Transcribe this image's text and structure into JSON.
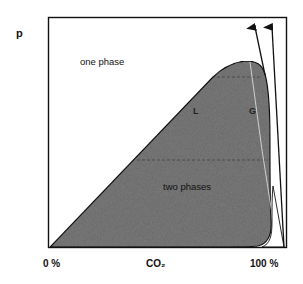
{
  "diagram": {
    "title": "",
    "y_axis_label": "p",
    "x_axis_label": "CO₂",
    "x_tick_left": "0 %",
    "x_tick_right": "100 %",
    "regions": {
      "one_phase": "one phase",
      "two_phases": "two phases",
      "liquid": "L",
      "gas": "G"
    },
    "colors": {
      "frame": "#111111",
      "two_phase_fill": "#7a7a7a",
      "background": "#ffffff"
    }
  }
}
